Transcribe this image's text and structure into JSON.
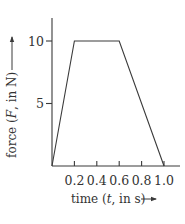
{
  "chart_data": {
    "type": "line",
    "title": "",
    "xlabel": "time (t, in s)",
    "ylabel": "force (F, in N)",
    "x": [
      0,
      0.2,
      0.6,
      1.0
    ],
    "series": [
      {
        "name": "force",
        "values": [
          0,
          10,
          10,
          0
        ]
      }
    ],
    "xlim": [
      0,
      1.0
    ],
    "ylim": [
      0,
      12
    ],
    "xticks": [
      0.2,
      0.4,
      0.6,
      0.8,
      1.0
    ],
    "xtick_labels": [
      "0.2",
      "0.4",
      "0.6",
      "0.8",
      "1.0"
    ],
    "yticks": [
      5,
      10
    ],
    "ytick_labels": [
      "5",
      "10"
    ],
    "grid": false,
    "legend": null,
    "color": "#3a3a3a"
  },
  "labels": {
    "x_axis": {
      "prefix": "time (",
      "var": "t",
      "suffix": ", in s)"
    },
    "y_axis": {
      "prefix": "force (",
      "var": "F",
      "suffix": ", in N)"
    }
  }
}
